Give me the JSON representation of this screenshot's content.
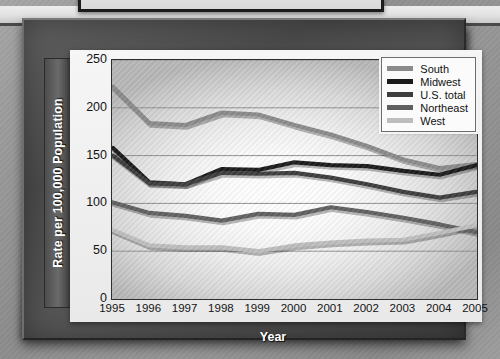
{
  "chart_data": {
    "type": "line",
    "title": "",
    "xlabel": "Year",
    "ylabel": "Rate per 100,000 Population",
    "categories": [
      1995,
      1996,
      1997,
      1998,
      1999,
      2000,
      2001,
      2002,
      2003,
      2004,
      2005
    ],
    "xlim": [
      1995,
      2005
    ],
    "ylim": [
      0,
      250
    ],
    "yticks": [
      0,
      50,
      100,
      150,
      200,
      250
    ],
    "grid": true,
    "legend_position": "top-right",
    "series": [
      {
        "name": "South",
        "color": "#8a8a8a",
        "values": [
          222,
          184,
          182,
          195,
          193,
          182,
          172,
          160,
          146,
          137,
          141
        ]
      },
      {
        "name": "Midwest",
        "color": "#1b1b1b",
        "values": [
          158,
          122,
          120,
          136,
          135,
          143,
          140,
          139,
          134,
          130,
          140
        ]
      },
      {
        "name": "U.S. total",
        "color": "#3d3d3d",
        "values": [
          150,
          121,
          120,
          132,
          131,
          132,
          127,
          120,
          112,
          106,
          112
        ]
      },
      {
        "name": "Northeast",
        "color": "#606060",
        "values": [
          101,
          90,
          87,
          82,
          89,
          88,
          96,
          91,
          85,
          78,
          70
        ]
      },
      {
        "name": "West",
        "color": "#bdbdbd",
        "values": [
          72,
          56,
          54,
          54,
          50,
          56,
          59,
          61,
          62,
          69,
          77
        ]
      }
    ]
  },
  "axis": {
    "y_title": "Rate per 100,000 Population",
    "x_title": "Year",
    "y_ticks": [
      "250",
      "200",
      "150",
      "100",
      "50",
      "0"
    ],
    "x_ticks": [
      "1995",
      "1996",
      "1997",
      "1998",
      "1999",
      "2000",
      "2001",
      "2002",
      "2003",
      "2004",
      "2005"
    ]
  },
  "legend": {
    "entries": [
      {
        "label": "South",
        "color": "#8a8a8a"
      },
      {
        "label": "Midwest",
        "color": "#1b1b1b"
      },
      {
        "label": "U.S. total",
        "color": "#3d3d3d"
      },
      {
        "label": "Northeast",
        "color": "#606060"
      },
      {
        "label": "West",
        "color": "#bdbdbd"
      }
    ]
  }
}
